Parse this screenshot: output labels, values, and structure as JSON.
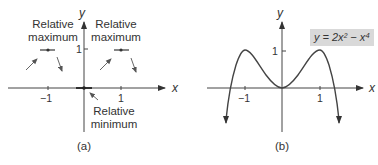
{
  "panel_a": {
    "caption": "(a)",
    "x_axis_label": "x",
    "y_axis_label": "y",
    "x_ticks": [
      "−1",
      "1"
    ],
    "y_ticks": [
      "1"
    ],
    "annotations": {
      "left_max_line1": "Relative",
      "left_max_line2": "maximum",
      "right_max_line1": "Relative",
      "right_max_line2": "maximum",
      "min_line1": "Relative",
      "min_line2": "minimum"
    }
  },
  "panel_b": {
    "caption": "(b)",
    "x_axis_label": "x",
    "y_axis_label": "y",
    "x_ticks": [
      "−1",
      "1"
    ],
    "y_ticks": [
      "1"
    ],
    "equation_label": "y = 2x² − x⁴",
    "equation_bg": "#d9d9d9"
  }
}
